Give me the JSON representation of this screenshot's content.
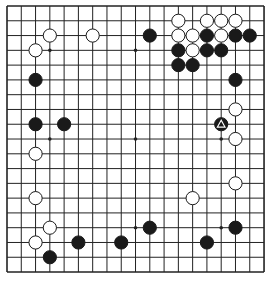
{
  "board": {
    "size": 19,
    "origin_x": 7,
    "origin_y": 6,
    "spacing_x": 14.28,
    "spacing_y": 14.78,
    "line_color": "#222222",
    "background": "#ffffff",
    "star_points": [
      [
        3,
        3
      ],
      [
        9,
        3
      ],
      [
        15,
        3
      ],
      [
        3,
        9
      ],
      [
        9,
        9
      ],
      [
        15,
        9
      ],
      [
        3,
        15
      ],
      [
        9,
        15
      ],
      [
        15,
        15
      ]
    ],
    "stones": [
      {
        "color": "white",
        "col": 3,
        "row": 2
      },
      {
        "color": "white",
        "col": 6,
        "row": 2
      },
      {
        "color": "white",
        "col": 2,
        "row": 3
      },
      {
        "color": "black",
        "col": 2,
        "row": 5
      },
      {
        "color": "black",
        "col": 2,
        "row": 8
      },
      {
        "color": "black",
        "col": 4,
        "row": 8
      },
      {
        "color": "black",
        "col": 10,
        "row": 2
      },
      {
        "color": "white",
        "col": 12,
        "row": 1
      },
      {
        "color": "white",
        "col": 14,
        "row": 1
      },
      {
        "color": "white",
        "col": 15,
        "row": 1
      },
      {
        "color": "white",
        "col": 16,
        "row": 1
      },
      {
        "color": "white",
        "col": 12,
        "row": 2
      },
      {
        "color": "white",
        "col": 13,
        "row": 2
      },
      {
        "color": "black",
        "col": 14,
        "row": 2
      },
      {
        "color": "white",
        "col": 15,
        "row": 2
      },
      {
        "color": "black",
        "col": 16,
        "row": 2
      },
      {
        "color": "black",
        "col": 17,
        "row": 2
      },
      {
        "color": "black",
        "col": 12,
        "row": 3
      },
      {
        "color": "white",
        "col": 13,
        "row": 3
      },
      {
        "color": "black",
        "col": 14,
        "row": 3
      },
      {
        "color": "black",
        "col": 15,
        "row": 3
      },
      {
        "color": "black",
        "col": 12,
        "row": 4
      },
      {
        "color": "black",
        "col": 13,
        "row": 4
      },
      {
        "color": "black",
        "col": 16,
        "row": 5
      },
      {
        "color": "white",
        "col": 16,
        "row": 7
      },
      {
        "color": "black",
        "col": 15,
        "row": 8,
        "marker": "triangle"
      },
      {
        "color": "white",
        "col": 16,
        "row": 9
      },
      {
        "color": "white",
        "col": 2,
        "row": 10
      },
      {
        "color": "white",
        "col": 16,
        "row": 12
      },
      {
        "color": "white",
        "col": 2,
        "row": 13
      },
      {
        "color": "white",
        "col": 13,
        "row": 13
      },
      {
        "color": "white",
        "col": 3,
        "row": 15
      },
      {
        "color": "black",
        "col": 10,
        "row": 15
      },
      {
        "color": "black",
        "col": 16,
        "row": 15
      },
      {
        "color": "white",
        "col": 2,
        "row": 16
      },
      {
        "color": "black",
        "col": 5,
        "row": 16
      },
      {
        "color": "black",
        "col": 8,
        "row": 16
      },
      {
        "color": "black",
        "col": 14,
        "row": 16
      },
      {
        "color": "black",
        "col": 3,
        "row": 17
      }
    ]
  }
}
